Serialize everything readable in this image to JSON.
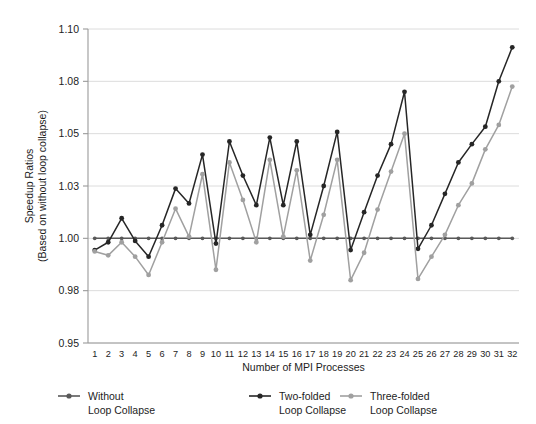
{
  "chart_data": {
    "type": "line",
    "title": "",
    "xlabel": "Number of MPI Processes",
    "ylabel_line1": "Speedup Ratios",
    "ylabel_line2": "(Based on without loop collapse)",
    "x": [
      1,
      2,
      3,
      4,
      5,
      6,
      7,
      8,
      9,
      10,
      11,
      12,
      13,
      14,
      15,
      16,
      17,
      18,
      19,
      20,
      21,
      22,
      23,
      24,
      25,
      26,
      27,
      28,
      29,
      30,
      31,
      32
    ],
    "categories": [
      "1",
      "2",
      "3",
      "4",
      "5",
      "6",
      "7",
      "8",
      "9",
      "10",
      "11",
      "12",
      "13",
      "14",
      "15",
      "16",
      "17",
      "18",
      "19",
      "20",
      "21",
      "22",
      "23",
      "24",
      "25",
      "26",
      "27",
      "28",
      "29",
      "30",
      "31",
      "32"
    ],
    "ytick_labels": [
      "1.10",
      "1.08",
      "1.05",
      "1.03",
      "1.00",
      "0.98",
      "0.95"
    ],
    "ytick_values": [
      1.1,
      1.08,
      1.05,
      1.03,
      1.0,
      0.98,
      0.95
    ],
    "ylim": [
      0.95,
      1.1
    ],
    "grid": true,
    "legend_position": "bottom",
    "series": [
      {
        "name": "Without\nLoop Collapse",
        "name_line1": "Without",
        "name_line2": "Loop Collapse",
        "color": "#595959",
        "marker": "circle",
        "values": [
          1.0,
          1.0,
          1.0,
          1.0,
          1.0,
          1.0,
          1.0,
          1.0,
          1.0,
          1.0,
          1.0,
          1.0,
          1.0,
          1.0,
          1.0,
          1.0,
          1.0,
          1.0,
          1.0,
          1.0,
          1.0,
          1.0,
          1.0,
          1.0,
          1.0,
          1.0,
          1.0,
          1.0,
          1.0,
          1.0,
          1.0,
          1.0
        ]
      },
      {
        "name": "Two-folded\nLoop Collapse",
        "name_line1": "Two-folded",
        "name_line2": "Loop Collapse",
        "color": "#262626",
        "marker": "circle",
        "values": [
          0.9955,
          0.9985,
          1.0115,
          0.999,
          0.993,
          1.0075,
          1.0285,
          1.02,
          1.042,
          0.998,
          1.047,
          1.034,
          1.019,
          1.0485,
          1.019,
          1.047,
          1.002,
          1.03,
          1.051,
          0.9955,
          1.015,
          1.034,
          1.046,
          1.074,
          0.996,
          1.0075,
          1.0255,
          1.039,
          1.046,
          1.054,
          1.08,
          1.093
        ]
      },
      {
        "name": "Three-folded\nLoop Collapse",
        "name_line1": "Three-folded",
        "name_line2": "Loop Collapse",
        "color": "#a0a0a0",
        "marker": "circle",
        "values": [
          0.995,
          0.9935,
          0.9985,
          0.993,
          0.986,
          0.9985,
          1.017,
          1.001,
          1.0345,
          0.988,
          1.039,
          1.022,
          0.9985,
          1.04,
          1.001,
          1.036,
          0.9915,
          1.0135,
          1.04,
          0.984,
          0.9945,
          1.0165,
          1.0355,
          1.05,
          0.9845,
          0.993,
          1.002,
          1.019,
          1.031,
          1.044,
          1.055,
          1.077
        ]
      }
    ]
  },
  "axis": {
    "x_title": "Number of MPI Processes",
    "y_title_line1": "Speedup Ratios",
    "y_title_line2": "(Based on without loop collapse)"
  },
  "legend": {
    "items": [
      {
        "label_line1": "Without",
        "label_line2": "Loop Collapse",
        "color": "#595959"
      },
      {
        "label_line1": "Two-folded",
        "label_line2": "Loop Collapse",
        "color": "#262626"
      },
      {
        "label_line1": "Three-folded",
        "label_line2": "Loop Collapse",
        "color": "#a0a0a0"
      }
    ]
  },
  "colors": {
    "background": "#ffffff",
    "grid": "#d8d8d8",
    "axis": "#9a9a9a",
    "text": "#1d1d1d"
  }
}
